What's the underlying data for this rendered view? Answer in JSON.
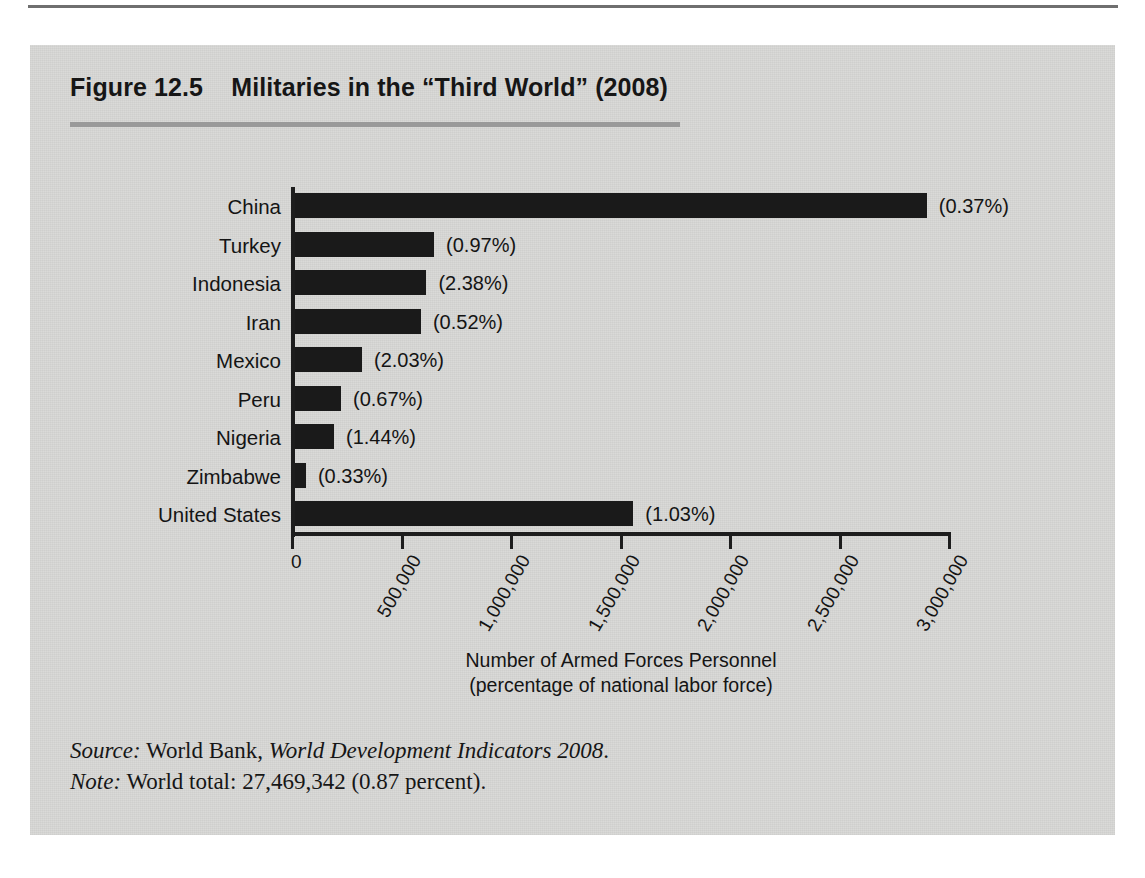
{
  "figure": {
    "title": "Figure 12.5    Militaries in the “Third World” (2008)",
    "source_label": "Source:",
    "source_text_plain": "World Bank, ",
    "source_text_italic": "World Development Indicators 2008",
    "source_text_end": ".",
    "note_label": "Note:",
    "note_text": "World total: 27,469,342 (0.87 percent)."
  },
  "chart_data": {
    "type": "bar",
    "orientation": "horizontal",
    "title": "Militaries in the “Third World” (2008)",
    "xlabel": "Number of Armed Forces Personnel",
    "xlabel_line2": "(percentage of national labor force)",
    "ylabel": "",
    "xlim": [
      0,
      3000000
    ],
    "grid": false,
    "legend": "none",
    "bar_color": "#1a1a1a",
    "categories": [
      "China",
      "Turkey",
      "Indonesia",
      "Iran",
      "Mexico",
      "Peru",
      "Nigeria",
      "Zimbabwe",
      "United States"
    ],
    "values": [
      2885000,
      635000,
      600000,
      575000,
      306000,
      210000,
      178000,
      50000,
      1545000
    ],
    "data_labels": [
      "(0.37%)",
      "(0.97%)",
      "(2.38%)",
      "(0.52%)",
      "(2.03%)",
      "(0.67%)",
      "(1.44%)",
      "(0.33%)",
      "(1.03%)"
    ],
    "percentages": [
      0.37,
      0.97,
      2.38,
      0.52,
      2.03,
      0.67,
      1.44,
      0.33,
      1.03
    ],
    "xticks": [
      0,
      500000,
      1000000,
      1500000,
      2000000,
      2500000,
      3000000
    ],
    "xticklabels": [
      "0",
      "500,000",
      "1,000,000",
      "1,500,000",
      "2,000,000",
      "2,500,000",
      "3,000,000"
    ],
    "world_total": 27469342,
    "world_total_percent": 0.87
  }
}
